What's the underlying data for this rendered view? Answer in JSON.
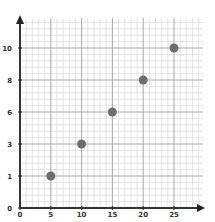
{
  "chart_data": {
    "type": "scatter",
    "title": "",
    "xlabel": "",
    "ylabel": "",
    "x": [
      5,
      10,
      15,
      20,
      25
    ],
    "y": [
      1,
      3,
      6,
      8,
      10
    ],
    "series": [
      {
        "name": "points",
        "x": [
          5,
          10,
          15,
          20,
          25
        ],
        "y": [
          1,
          3,
          6,
          8,
          10
        ]
      }
    ],
    "x_ticks": [
      "0",
      "5",
      "10",
      "15",
      "20",
      "25"
    ],
    "y_ticks": [
      "0",
      "1",
      "3",
      "6",
      "8",
      "10"
    ],
    "xlim": [
      0,
      30
    ],
    "ylim": [
      0,
      12
    ],
    "grid": true,
    "legend": "none",
    "marker_color": "#6e6e6e",
    "axis_color": "#333333",
    "major_grid_color": "#a8a8a8",
    "minor_grid_color": "#dcdcdc"
  }
}
